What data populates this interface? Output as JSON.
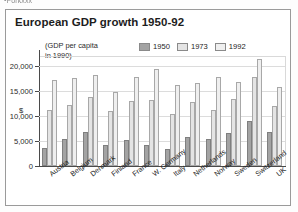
{
  "page": {
    "bleed_text_above": "Porkxxx"
  },
  "figure": {
    "title": "European GDP growth 1950-92",
    "axis_note_line1": "(GDP per capita",
    "axis_note_line2": "in 1990)",
    "y_unit": "$"
  },
  "legend": {
    "position": "top-right",
    "items": [
      {
        "label": "1950",
        "color": "#a3a3a3"
      },
      {
        "label": "1973",
        "color": "#e4e4e4"
      },
      {
        "label": "1992",
        "color": "#efefef"
      }
    ]
  },
  "chart_data": {
    "type": "bar",
    "title": "European GDP growth 1950-92",
    "xlabel": "",
    "ylabel": "$",
    "ylim": [
      0,
      22000
    ],
    "yticks": [
      "0",
      "5,000",
      "10,000",
      "15,000",
      "20,000"
    ],
    "ytick_values": [
      0,
      5000,
      10000,
      15000,
      20000
    ],
    "grid": true,
    "annotation": "(GDP per capita in 1990)",
    "categories": [
      "Austria",
      "Belgium",
      "Denmark",
      "Finland",
      "France",
      "W. Germany",
      "Italy",
      "Netherlands",
      "Norway",
      "Sweden",
      "Switzerland",
      "UK"
    ],
    "series": [
      {
        "name": "1950",
        "color": "#a3a3a3",
        "values": [
          3700,
          5500,
          6900,
          4300,
          5200,
          4300,
          3500,
          5900,
          5400,
          6700,
          9100,
          6900
        ]
      },
      {
        "name": "1973",
        "color": "#e4e4e4",
        "values": [
          11200,
          12200,
          13900,
          11000,
          13000,
          13200,
          10400,
          12800,
          11200,
          13500,
          17900,
          12000
        ]
      },
      {
        "name": "1992",
        "color": "#efefef",
        "values": [
          17200,
          17700,
          18300,
          14800,
          17900,
          19400,
          16200,
          16600,
          17800,
          16900,
          21400,
          15900
        ]
      }
    ]
  }
}
